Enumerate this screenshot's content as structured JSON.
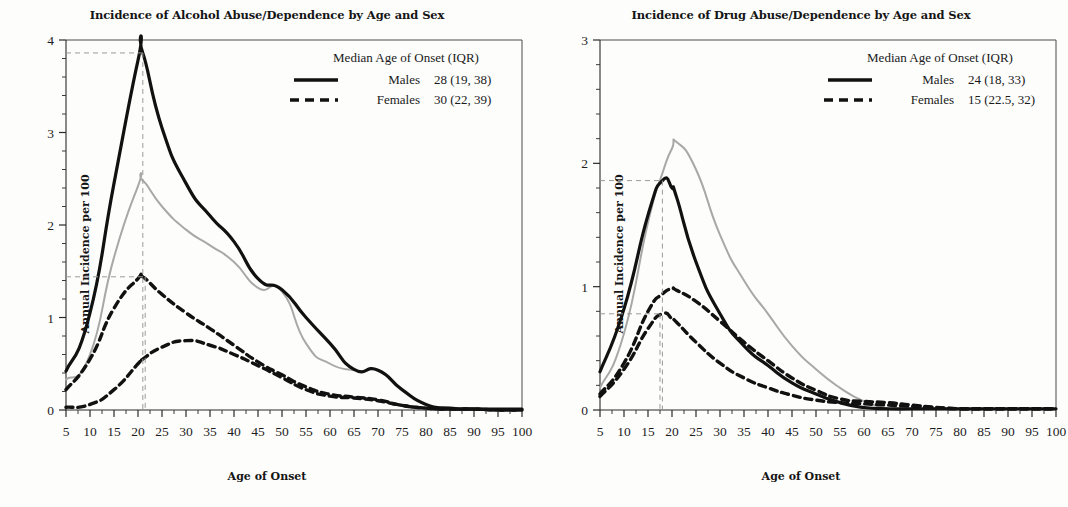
{
  "charts": [
    {
      "id": "alcohol",
      "title": "Incidence of Alcohol Abuse/Dependence by Age and Sex",
      "xlabel": "Age of Onset",
      "ylabel": "Annual Incidence per 100",
      "legend_title": "Median Age of Onset (IQR)",
      "legend": [
        {
          "label": "Males",
          "value": "28 (19, 38)",
          "style": "solid"
        },
        {
          "label": "Females",
          "value": "30 (22, 39)",
          "style": "dashed"
        }
      ],
      "ylim": [
        0,
        4
      ],
      "yticks": [
        "0",
        "1",
        "2",
        "3",
        "4"
      ],
      "xlim": [
        5,
        100
      ],
      "xticks": [
        "5",
        "10",
        "15",
        "20",
        "25",
        "30",
        "35",
        "40",
        "45",
        "50",
        "55",
        "60",
        "65",
        "70",
        "75",
        "80",
        "85",
        "90",
        "95",
        "100"
      ],
      "guide_x": 21,
      "guide_y": 3.86,
      "guide_x2": 21.5,
      "guide_y2": 1.44
    },
    {
      "id": "drug",
      "title": "Incidence of Drug Abuse/Dependence by Age and Sex",
      "xlabel": "Age of Onset",
      "ylabel": "Annual Incidence per 100",
      "legend_title": "Median Age of Onset (IQR)",
      "legend": [
        {
          "label": "Males",
          "value": "24 (18, 33)",
          "style": "solid"
        },
        {
          "label": "Females",
          "value": "15 (22.5, 32)",
          "style": "dashed"
        }
      ],
      "ylim": [
        0,
        3
      ],
      "yticks": [
        "0",
        "1",
        "2",
        "3"
      ],
      "xlim": [
        5,
        100
      ],
      "xticks": [
        "5",
        "10",
        "15",
        "20",
        "25",
        "30",
        "35",
        "40",
        "45",
        "50",
        "55",
        "60",
        "65",
        "70",
        "75",
        "80",
        "85",
        "90",
        "95",
        "100"
      ],
      "guide_x": 18,
      "guide_y": 1.86,
      "guide_x2": 17.5,
      "guide_y2": 0.78
    }
  ],
  "chart_data": [
    {
      "type": "line",
      "title": "Incidence of Alcohol Abuse/Dependence by Age and Sex",
      "xlabel": "Age of Onset",
      "ylabel": "Annual Incidence per 100",
      "xlim": [
        5,
        100
      ],
      "ylim": [
        0,
        4
      ],
      "grid": false,
      "legend_position": "top-right",
      "legend_title": "Median Age of Onset (IQR)",
      "annotations": [
        "Males median age of onset 28 (IQR 19, 38)",
        "Females median age of onset 30 (IQR 22, 39)"
      ],
      "x": [
        5,
        10,
        15,
        20,
        21,
        25,
        30,
        35,
        40,
        45,
        50,
        55,
        60,
        65,
        70,
        75,
        80,
        85,
        90,
        95,
        100
      ],
      "series": [
        {
          "name": "Males (black solid)",
          "color": "#111111",
          "style": "solid",
          "values": [
            0.42,
            1.05,
            2.45,
            3.78,
            3.86,
            3.05,
            2.45,
            2.1,
            1.82,
            1.42,
            1.3,
            1.0,
            0.72,
            0.44,
            0.43,
            0.22,
            0.06,
            0.02,
            0.01,
            0.01,
            0.01
          ]
        },
        {
          "name": "Males (gray solid, second cohort)",
          "color": "#a8a8a8",
          "style": "solid",
          "values": [
            0.33,
            0.6,
            1.65,
            2.42,
            2.48,
            2.2,
            1.95,
            1.78,
            1.6,
            1.32,
            1.28,
            0.72,
            0.5,
            0.43,
            0.0,
            0.0,
            0.0,
            0.0,
            0.0,
            0.0,
            0.0
          ]
        },
        {
          "name": "Females (black dashed, upper)",
          "color": "#111111",
          "style": "dashed",
          "values": [
            0.22,
            0.55,
            1.1,
            1.42,
            1.44,
            1.25,
            1.05,
            0.88,
            0.7,
            0.52,
            0.38,
            0.25,
            0.17,
            0.14,
            0.11,
            0.05,
            0.02,
            0.01,
            0.01,
            0.0,
            0.0
          ]
        },
        {
          "name": "Females (black dashed, lower)",
          "color": "#111111",
          "style": "dashed",
          "values": [
            0.03,
            0.06,
            0.22,
            0.5,
            0.55,
            0.68,
            0.75,
            0.7,
            0.6,
            0.48,
            0.35,
            0.22,
            0.15,
            0.13,
            0.1,
            0.05,
            0.02,
            0.01,
            0.01,
            0.0,
            0.0
          ]
        }
      ]
    },
    {
      "type": "line",
      "title": "Incidence of Drug Abuse/Dependence by Age and Sex",
      "xlabel": "Age of Onset",
      "ylabel": "Annual Incidence per 100",
      "xlim": [
        5,
        100
      ],
      "ylim": [
        0,
        3
      ],
      "grid": false,
      "legend_position": "top-right",
      "legend_title": "Median Age of Onset (IQR)",
      "annotations": [
        "Males median age of onset 24 (IQR 18, 33)",
        "Females median age of onset 15 (IQR 22.5, 32)"
      ],
      "x": [
        5,
        10,
        15,
        18,
        20,
        21,
        25,
        30,
        35,
        40,
        45,
        50,
        55,
        60,
        65,
        70,
        75,
        80,
        85,
        90,
        95,
        100
      ],
      "series": [
        {
          "name": "Males (black solid)",
          "color": "#111111",
          "style": "solid",
          "values": [
            0.31,
            0.82,
            1.58,
            1.86,
            1.8,
            1.72,
            1.2,
            0.78,
            0.52,
            0.36,
            0.22,
            0.13,
            0.06,
            0.02,
            0.01,
            0.01,
            0.01,
            0.01,
            0.01,
            0.01,
            0.01,
            0.01
          ]
        },
        {
          "name": "Males (gray solid, second cohort)",
          "color": "#a8a8a8",
          "style": "solid",
          "values": [
            0.18,
            0.62,
            1.52,
            1.92,
            2.12,
            2.17,
            1.95,
            1.42,
            1.05,
            0.78,
            0.52,
            0.33,
            0.18,
            0.07,
            0.01,
            0.0,
            0.0,
            0.0,
            0.0,
            0.0,
            0.0,
            0.0
          ]
        },
        {
          "name": "Females (black dashed, upper)",
          "color": "#111111",
          "style": "dashed",
          "values": [
            0.13,
            0.38,
            0.8,
            0.94,
            0.98,
            0.97,
            0.88,
            0.72,
            0.55,
            0.4,
            0.26,
            0.16,
            0.09,
            0.07,
            0.06,
            0.04,
            0.02,
            0.01,
            0.01,
            0.01,
            0.01,
            0.01
          ]
        },
        {
          "name": "Females (black dashed, lower)",
          "color": "#111111",
          "style": "dashed",
          "values": [
            0.11,
            0.33,
            0.66,
            0.78,
            0.74,
            0.71,
            0.55,
            0.38,
            0.26,
            0.18,
            0.12,
            0.08,
            0.06,
            0.05,
            0.04,
            0.03,
            0.02,
            0.01,
            0.01,
            0.01,
            0.01,
            0.01
          ]
        }
      ]
    }
  ]
}
